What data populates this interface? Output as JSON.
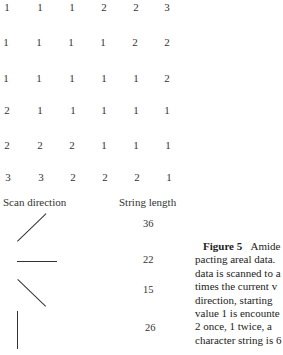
{
  "grid": {
    "rows": [
      [
        "1",
        "1",
        "1",
        "2",
        "2",
        "3"
      ],
      [
        "1",
        "1",
        "1",
        "1",
        "2",
        "2"
      ],
      [
        "1",
        "1",
        "1",
        "1",
        "1",
        "2"
      ],
      [
        "2",
        "1",
        "1",
        "1",
        "1",
        "1"
      ],
      [
        "2",
        "2",
        "2",
        "1",
        "1",
        "1"
      ],
      [
        "3",
        "3",
        "2",
        "2",
        "2",
        "1"
      ]
    ]
  },
  "table": {
    "col1_header": "Scan direction",
    "col2_header": "String length",
    "rows": [
      {
        "direction": "diagonal-up-right",
        "length": "36"
      },
      {
        "direction": "horizontal",
        "length": "22"
      },
      {
        "direction": "diagonal-down-right",
        "length": "15"
      },
      {
        "direction": "vertical",
        "length": "26"
      }
    ]
  },
  "caption": {
    "figure_label": "Figure 5",
    "lines": [
      "Amide",
      "pacting areal data.",
      "data is scanned to a",
      "times the current v",
      "direction, starting",
      "value 1 is encounte",
      "2 once, 1 twice, a",
      "character string is 6"
    ]
  }
}
